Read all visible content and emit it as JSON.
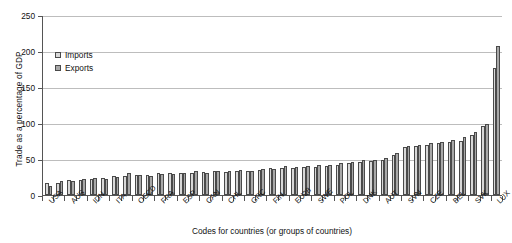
{
  "chart_data": {
    "type": "bar",
    "title": "",
    "xlabel": "Codes for countries (or groups of countries)",
    "ylabel": "Trade as a percentage of GDP",
    "ylim": [
      0,
      250
    ],
    "yticks": [
      0,
      50,
      100,
      150,
      200,
      250
    ],
    "grid": true,
    "legend_position": "upper-left",
    "categories": [
      "USA",
      "BRA",
      "AUS",
      "ARG",
      "IDN",
      "JPN",
      "ITA",
      "TUR",
      "OECD",
      "COL",
      "FRA",
      "GBR",
      "ESP",
      "NZL",
      "CAN",
      "ISR",
      "CHL",
      "NOR",
      "GRC",
      "PRT",
      "FIN",
      "DEU",
      "EU28",
      "ISL",
      "SWE",
      "LVA",
      "POL",
      "CHE",
      "DNK",
      "KOR",
      "AUT",
      "EST",
      "SVN",
      "LTU",
      "CZE",
      "NLD",
      "BEL",
      "IRL",
      "SVK",
      "HUN",
      "LUX"
    ],
    "visible_tick_labels": [
      "USA",
      "AUS",
      "IDN",
      "ITA",
      "OECD",
      "FRA",
      "ESP",
      "CAN",
      "CHL",
      "GRC",
      "FIN",
      "EU28",
      "SWE",
      "POL",
      "DNK",
      "AUT",
      "SVN",
      "CZE",
      "BEL",
      "SVK",
      "LUX"
    ],
    "series": [
      {
        "name": "Imports",
        "color": "#d8d8d8",
        "values": [
          16,
          17,
          21,
          21,
          22,
          24,
          26,
          27,
          28,
          28,
          30,
          30,
          30,
          31,
          32,
          33,
          32,
          33,
          34,
          35,
          37,
          38,
          38,
          39,
          39,
          40,
          42,
          44,
          46,
          47,
          48,
          56,
          66,
          68,
          70,
          72,
          74,
          75,
          83,
          96,
          177
        ]
      },
      {
        "name": "Exports",
        "color": "#a8a8a8",
        "values": [
          13,
          19,
          19,
          22,
          23,
          22,
          25,
          30,
          28,
          26,
          29,
          29,
          31,
          33,
          31,
          34,
          33,
          35,
          33,
          36,
          36,
          40,
          39,
          40,
          42,
          42,
          44,
          46,
          48,
          49,
          52,
          58,
          68,
          70,
          72,
          74,
          76,
          80,
          87,
          99,
          207
        ]
      }
    ]
  },
  "legend": {
    "items": [
      {
        "label": "Imports",
        "key": "imports"
      },
      {
        "label": "Exports",
        "key": "exports"
      }
    ]
  }
}
